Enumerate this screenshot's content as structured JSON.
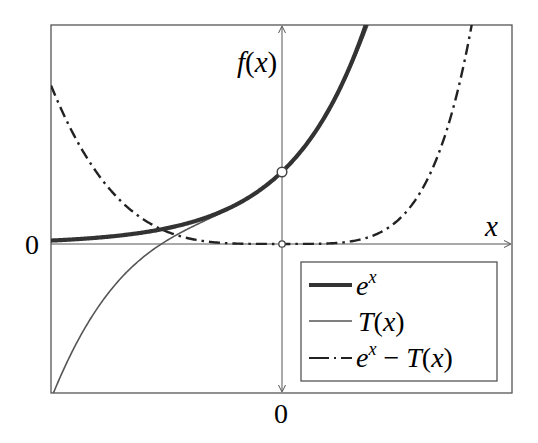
{
  "chart_data": {
    "type": "line",
    "title": "",
    "xlabel": "x",
    "ylabel": "f(x)",
    "xlim": [
      -3.06,
      3.05
    ],
    "ylim": [
      -2.07,
      3.04
    ],
    "x_ticks": [
      {
        "value": 0,
        "label": "0"
      }
    ],
    "y_ticks": [
      {
        "value": 0,
        "label": "0"
      }
    ],
    "grid": false,
    "legend_position": "lower right",
    "series": [
      {
        "name": "e^x",
        "label_base": "e",
        "label_sup": "x",
        "style": "thick-solid",
        "color": "#333333",
        "function": "exp(x)"
      },
      {
        "name": "T(x)",
        "label": "T(x)",
        "style": "thin-solid",
        "color": "#555555",
        "function": "1 + x + x^2/2 + x^3/6"
      },
      {
        "name": "e^x - T(x)",
        "label_base": "e",
        "label_sup": "x",
        "label_rest": " − T(x)",
        "style": "dash-dot",
        "color": "#222222",
        "function": "exp(x) - (1 + x + x^2/2 + x^3/6)"
      }
    ],
    "markers": [
      {
        "x": 0,
        "y": 1,
        "type": "open-circle",
        "series": "e^x"
      },
      {
        "x": 0,
        "y": 0,
        "type": "open-circle",
        "series": "e^x - T(x)"
      }
    ],
    "sample_points": {
      "x": [
        -3,
        -2,
        -1,
        0,
        1,
        2,
        2.5
      ],
      "e^x": [
        0.05,
        0.14,
        0.37,
        1.0,
        2.72,
        7.39,
        12.18
      ],
      "T(x)": [
        -2.0,
        -0.33,
        0.33,
        1.0,
        2.67,
        6.33,
        9.23
      ],
      "e^x - T(x)": [
        2.05,
        0.47,
        0.03,
        0.0,
        0.05,
        1.06,
        2.95
      ]
    }
  },
  "labels": {
    "y_axis": "f(x)",
    "x_axis": "x",
    "x_zero": "0",
    "y_zero": "0"
  },
  "legend": {
    "items": [
      {
        "text": "e^x"
      },
      {
        "text": "T(x)"
      },
      {
        "text": "e^x − T(x)"
      }
    ]
  }
}
